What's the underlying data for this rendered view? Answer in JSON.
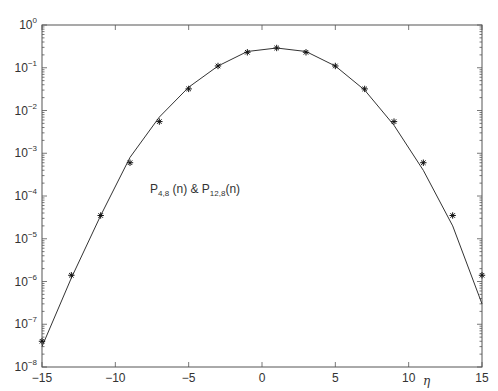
{
  "chart_data": {
    "type": "line",
    "title": "",
    "xlabel": "η",
    "ylabel": "",
    "xlim": [
      -15,
      15
    ],
    "ylim": [
      1e-08,
      1
    ],
    "yscale": "log",
    "grid": false,
    "x_ticks": [
      -15,
      -10,
      -5,
      0,
      5,
      10,
      15
    ],
    "x_tick_labels": [
      "-15",
      "-10",
      "-5",
      "0",
      "5",
      "10",
      "15"
    ],
    "y_tick_exponents": [
      0,
      -1,
      -2,
      -3,
      -4,
      -5,
      -6,
      -7,
      -8
    ],
    "annotation": {
      "text_parts": [
        "P",
        "4,8",
        " (n) & P",
        "12,8",
        "(n)"
      ],
      "x": -10.4,
      "y_log": -4.4
    },
    "series": [
      {
        "name": "P_4,8(n) (line)",
        "style": "line",
        "color": "#333333",
        "x": [
          -15,
          -13,
          -11,
          -9,
          -7,
          -5,
          -3,
          -1,
          1,
          3,
          5,
          7,
          9,
          11,
          13,
          15
        ],
        "values": [
          3e-08,
          1.2e-06,
          3.5e-05,
          0.0008,
          0.007,
          0.035,
          0.11,
          0.24,
          0.29,
          0.24,
          0.11,
          0.03,
          0.0045,
          0.0004,
          2e-05,
          3e-07
        ]
      },
      {
        "name": "P_12,8(n) (markers)",
        "style": "marker",
        "marker": "asterisk",
        "color": "#111111",
        "x": [
          -15,
          -13,
          -11,
          -9,
          -7,
          -5,
          -3,
          -1,
          1,
          3,
          5,
          7,
          9,
          11,
          13,
          15
        ],
        "values": [
          4e-08,
          1.4e-06,
          3.5e-05,
          0.0006,
          0.0055,
          0.032,
          0.11,
          0.23,
          0.29,
          0.23,
          0.11,
          0.032,
          0.0055,
          0.0006,
          3.5e-05,
          1.4e-06
        ]
      }
    ]
  }
}
